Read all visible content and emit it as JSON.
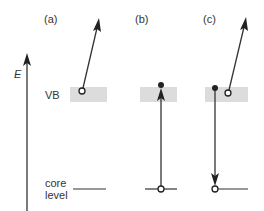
{
  "figure": {
    "axis_label": "E",
    "panels": [
      {
        "id": "a",
        "label": "(a)"
      },
      {
        "id": "b",
        "label": "(b)"
      },
      {
        "id": "c",
        "label": "(c)"
      }
    ],
    "levels": {
      "valence_band": "VB",
      "core_line1": "core",
      "core_line2": "level"
    },
    "colors": {
      "line": "#333333",
      "band": "#dcdcdc",
      "background": "#ffffff"
    }
  }
}
